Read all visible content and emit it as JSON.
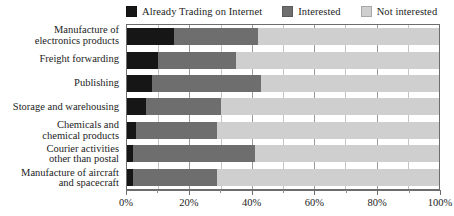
{
  "chart_data": {
    "type": "bar",
    "orientation": "horizontal",
    "stacked": true,
    "stacked_percent": true,
    "title": "",
    "xlabel": "",
    "ylabel": "",
    "xlim": [
      0,
      100
    ],
    "xticks": [
      0,
      20,
      40,
      60,
      80,
      100
    ],
    "xtick_labels": [
      "0%",
      "20%",
      "40%",
      "60%",
      "80%",
      "100%"
    ],
    "minor_xticks": [
      10,
      30,
      50,
      70,
      90
    ],
    "grid": true,
    "legend_position": "top",
    "categories": [
      "Manufacture of\nelectronics products",
      "Freight forwarding",
      "Publishing",
      "Storage and warehousing",
      "Chemicals and\nchemical products",
      "Courier activities\nother than postal",
      "Manufacture of aircraft\nand spacecraft"
    ],
    "series": [
      {
        "name": "Already Trading on Internet",
        "color": "#161616",
        "values": [
          15,
          10,
          8,
          6,
          3,
          2,
          2
        ]
      },
      {
        "name": "Interested",
        "color": "#6e6e6e",
        "values": [
          27,
          25,
          35,
          24,
          26,
          39,
          27
        ]
      },
      {
        "name": "Not interested",
        "color": "#cfcfcf",
        "values": [
          58,
          65,
          57,
          70,
          71,
          59,
          71
        ]
      }
    ]
  },
  "legend": {
    "items": [
      {
        "label": "Already Trading on Internet",
        "color": "#161616"
      },
      {
        "label": "Interested",
        "color": "#6e6e6e"
      },
      {
        "label": "Not interested",
        "color": "#cfcfcf"
      }
    ]
  },
  "axis": {
    "frame_color": "#6d6d6d",
    "gridline_color": "#9a9a9a"
  }
}
